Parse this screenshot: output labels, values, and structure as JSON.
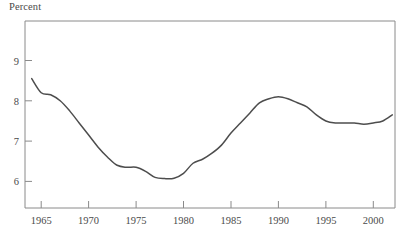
{
  "chart_data": {
    "type": "line",
    "title": "",
    "subtitle": "",
    "ylabel": "Percent",
    "xlabel": "",
    "xlim": [
      1963.5,
      2002.5
    ],
    "ylim": [
      5.5,
      9.6
    ],
    "grid": false,
    "legend": null,
    "y_ticks": [
      "9",
      "8",
      "7",
      "6"
    ],
    "y_tick_values": [
      9,
      8,
      7,
      6
    ],
    "x_ticks": [
      "1965",
      "1970",
      "1975",
      "1980",
      "1985",
      "1990",
      "1995",
      "2000"
    ],
    "x_tick_values": [
      1965,
      1970,
      1975,
      1980,
      1985,
      1990,
      1995,
      2000
    ],
    "series": [
      {
        "name": "Percent",
        "color": "#4d4d4d",
        "x": [
          1964,
          1965,
          1966,
          1967,
          1968,
          1969,
          1970,
          1971,
          1972,
          1973,
          1974,
          1975,
          1976,
          1977,
          1978,
          1979,
          1980,
          1981,
          1982,
          1983,
          1984,
          1985,
          1986,
          1987,
          1988,
          1989,
          1990,
          1991,
          1992,
          1993,
          1994,
          1995,
          1996,
          1997,
          1998,
          1999,
          2000,
          2001,
          2002
        ],
        "values": [
          8.55,
          8.2,
          8.15,
          8.0,
          7.75,
          7.45,
          7.15,
          6.85,
          6.6,
          6.4,
          6.35,
          6.35,
          6.25,
          6.1,
          6.07,
          6.08,
          6.2,
          6.45,
          6.55,
          6.7,
          6.9,
          7.2,
          7.45,
          7.7,
          7.95,
          8.05,
          8.1,
          8.05,
          7.95,
          7.85,
          7.65,
          7.5,
          7.45,
          7.45,
          7.45,
          7.42,
          7.45,
          7.5,
          7.65
        ]
      }
    ]
  },
  "axes": {
    "y_axis_name": "percent-axis",
    "x_axis_name": "year-axis"
  }
}
